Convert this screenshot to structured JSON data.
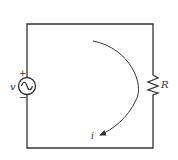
{
  "diagram": {
    "type": "circuit",
    "components": [
      {
        "id": "source",
        "kind": "ac-voltage-source",
        "label": "v",
        "polarity_top": "+",
        "polarity_bottom": "−"
      },
      {
        "id": "resistor",
        "kind": "resistor",
        "label": "R"
      }
    ],
    "current": {
      "label": "i",
      "direction": "clockwise"
    }
  },
  "colors": {
    "wire": "#333333",
    "background": "#ffffff"
  }
}
